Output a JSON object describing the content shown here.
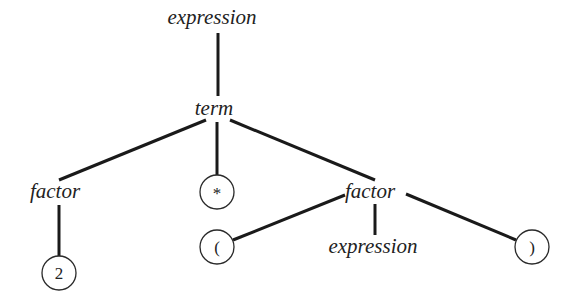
{
  "diagram": {
    "type": "parse-tree",
    "nodes": {
      "root": {
        "label": "expression",
        "kind": "nonterminal"
      },
      "term": {
        "label": "term",
        "kind": "nonterminal"
      },
      "factor_left": {
        "label": "factor",
        "kind": "nonterminal"
      },
      "star": {
        "label": "*",
        "kind": "terminal"
      },
      "factor_right": {
        "label": "factor",
        "kind": "nonterminal"
      },
      "two": {
        "label": "2",
        "kind": "terminal"
      },
      "lparen": {
        "label": "(",
        "kind": "terminal"
      },
      "inner_expression": {
        "label": "expression",
        "kind": "nonterminal"
      },
      "rparen": {
        "label": ")",
        "kind": "terminal"
      }
    },
    "edges": [
      [
        "root",
        "term"
      ],
      [
        "term",
        "factor_left"
      ],
      [
        "term",
        "star"
      ],
      [
        "term",
        "factor_right"
      ],
      [
        "factor_left",
        "two"
      ],
      [
        "factor_right",
        "lparen"
      ],
      [
        "factor_right",
        "inner_expression"
      ],
      [
        "factor_right",
        "rparen"
      ]
    ],
    "colors": {
      "line": "#1a1a1a",
      "text": "#222222",
      "background": "#ffffff"
    }
  }
}
